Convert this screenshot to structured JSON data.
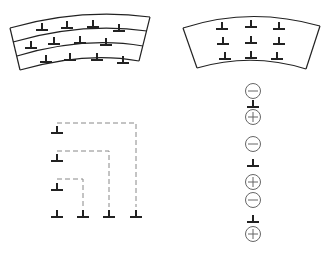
{
  "diagram": {
    "type": "dislocation schematic",
    "colors": {
      "stroke": "#222222",
      "dashed": "#888888",
      "circle": "#666666",
      "background": "#ffffff"
    },
    "panels": [
      {
        "id": "top-left",
        "description": "Curved bent crystal band divided into three arc layers, each containing four edge dislocations (⊥)",
        "layers": 3,
        "dislocations_per_layer": 4,
        "symbol": "edge-dislocation"
      },
      {
        "id": "top-right",
        "description": "Curved bent crystal region with edge dislocations arranged in a 3×3 polygonized grid",
        "rows": 3,
        "columns": 3,
        "symbol": "edge-dislocation"
      },
      {
        "id": "bottom-left",
        "description": "Edge dislocations on a staircase climbing path connected by dashed lines to a bottom row of four",
        "left_column": 3,
        "bottom_row": 4,
        "connector": "dashed"
      },
      {
        "id": "bottom-right",
        "description": "Vertical chain of alternating minus/plus point defects and edge dislocations",
        "sequence": [
          "minus",
          "dislocation",
          "plus",
          "minus",
          "dislocation",
          "plus",
          "minus",
          "dislocation",
          "plus"
        ],
        "labels": {
          "minus": "−",
          "plus": "+"
        }
      }
    ]
  }
}
